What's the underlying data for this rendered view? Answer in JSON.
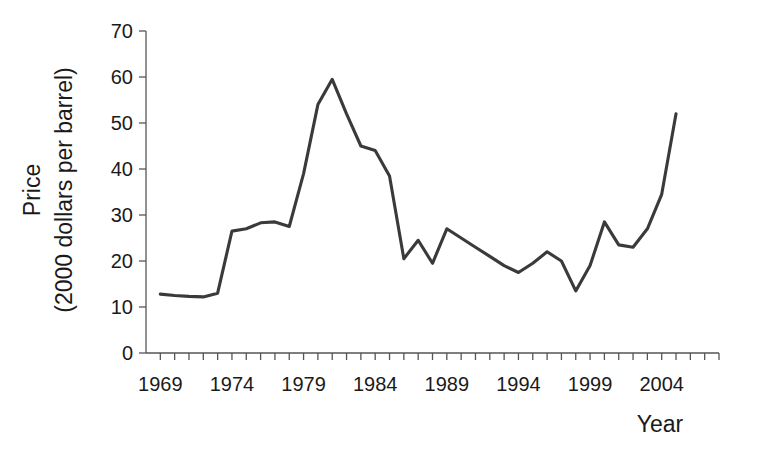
{
  "chart_data": {
    "type": "line",
    "title": "",
    "xlabel": "Year",
    "ylabel": "Price\n(2000 dollars per barrel)",
    "ylabel_line1": "Price",
    "ylabel_line2": "(2000 dollars per barrel)",
    "xlim": [
      1968,
      2008
    ],
    "ylim": [
      0,
      70
    ],
    "grid": false,
    "legend": false,
    "x_tick_labels": [
      "1969",
      "1974",
      "1979",
      "1984",
      "1989",
      "1994",
      "1999",
      "2004"
    ],
    "x_tick_values": [
      1969,
      1974,
      1979,
      1984,
      1989,
      1994,
      1999,
      2004
    ],
    "x_minor_tick_step": 1,
    "y_tick_labels": [
      "0",
      "10",
      "20",
      "30",
      "40",
      "50",
      "60",
      "70"
    ],
    "y_tick_values": [
      0,
      10,
      20,
      30,
      40,
      50,
      60,
      70
    ],
    "series": [
      {
        "name": "Crude oil price",
        "color": "#3a3a3a",
        "x": [
          1969,
          1970,
          1971,
          1972,
          1973,
          1974,
          1975,
          1976,
          1977,
          1978,
          1979,
          1980,
          1981,
          1982,
          1983,
          1984,
          1985,
          1986,
          1987,
          1988,
          1989,
          1990,
          1991,
          1992,
          1993,
          1994,
          1995,
          1996,
          1997,
          1998,
          1999,
          2000,
          2001,
          2002,
          2003,
          2004,
          2005
        ],
        "values": [
          12.8,
          12.5,
          12.3,
          12.2,
          13.0,
          26.5,
          27.0,
          28.3,
          28.5,
          27.5,
          39.0,
          54.0,
          59.5,
          52.0,
          45.0,
          44.0,
          38.5,
          20.5,
          24.5,
          19.5,
          27.0,
          25.0,
          23.0,
          21.0,
          19.0,
          17.5,
          19.5,
          22.0,
          20.0,
          13.5,
          19.0,
          28.5,
          23.5,
          23.0,
          27.0,
          34.5,
          52.0
        ]
      }
    ]
  },
  "axes": {
    "x_axis_name": "year-axis",
    "y_axis_name": "price-axis"
  }
}
